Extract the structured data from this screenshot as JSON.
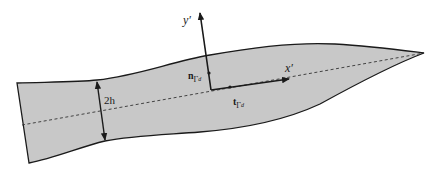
{
  "diagram": {
    "colors": {
      "fill": "#c8c8c8",
      "stroke": "#1a1a1a",
      "centerline": "#333333",
      "background": "#ffffff"
    },
    "labels": {
      "y_axis": "y′",
      "x_axis": "x′",
      "thickness": "2h",
      "normal_vector": {
        "symbol": "n",
        "subscript": "Γ",
        "subsubscript": "d"
      },
      "tangent_vector": {
        "symbol": "t",
        "subscript": "Γ",
        "subsubscript": "d"
      }
    },
    "shapes": {
      "body": "tapered elongated domain (lens/blade shape) with dashed centerline",
      "local_frame": "orthogonal axes x′ (tangent) and y′ (normal) at a point on centerline",
      "thickness_marker": "double-headed arrow spanning thickness 2h"
    }
  }
}
